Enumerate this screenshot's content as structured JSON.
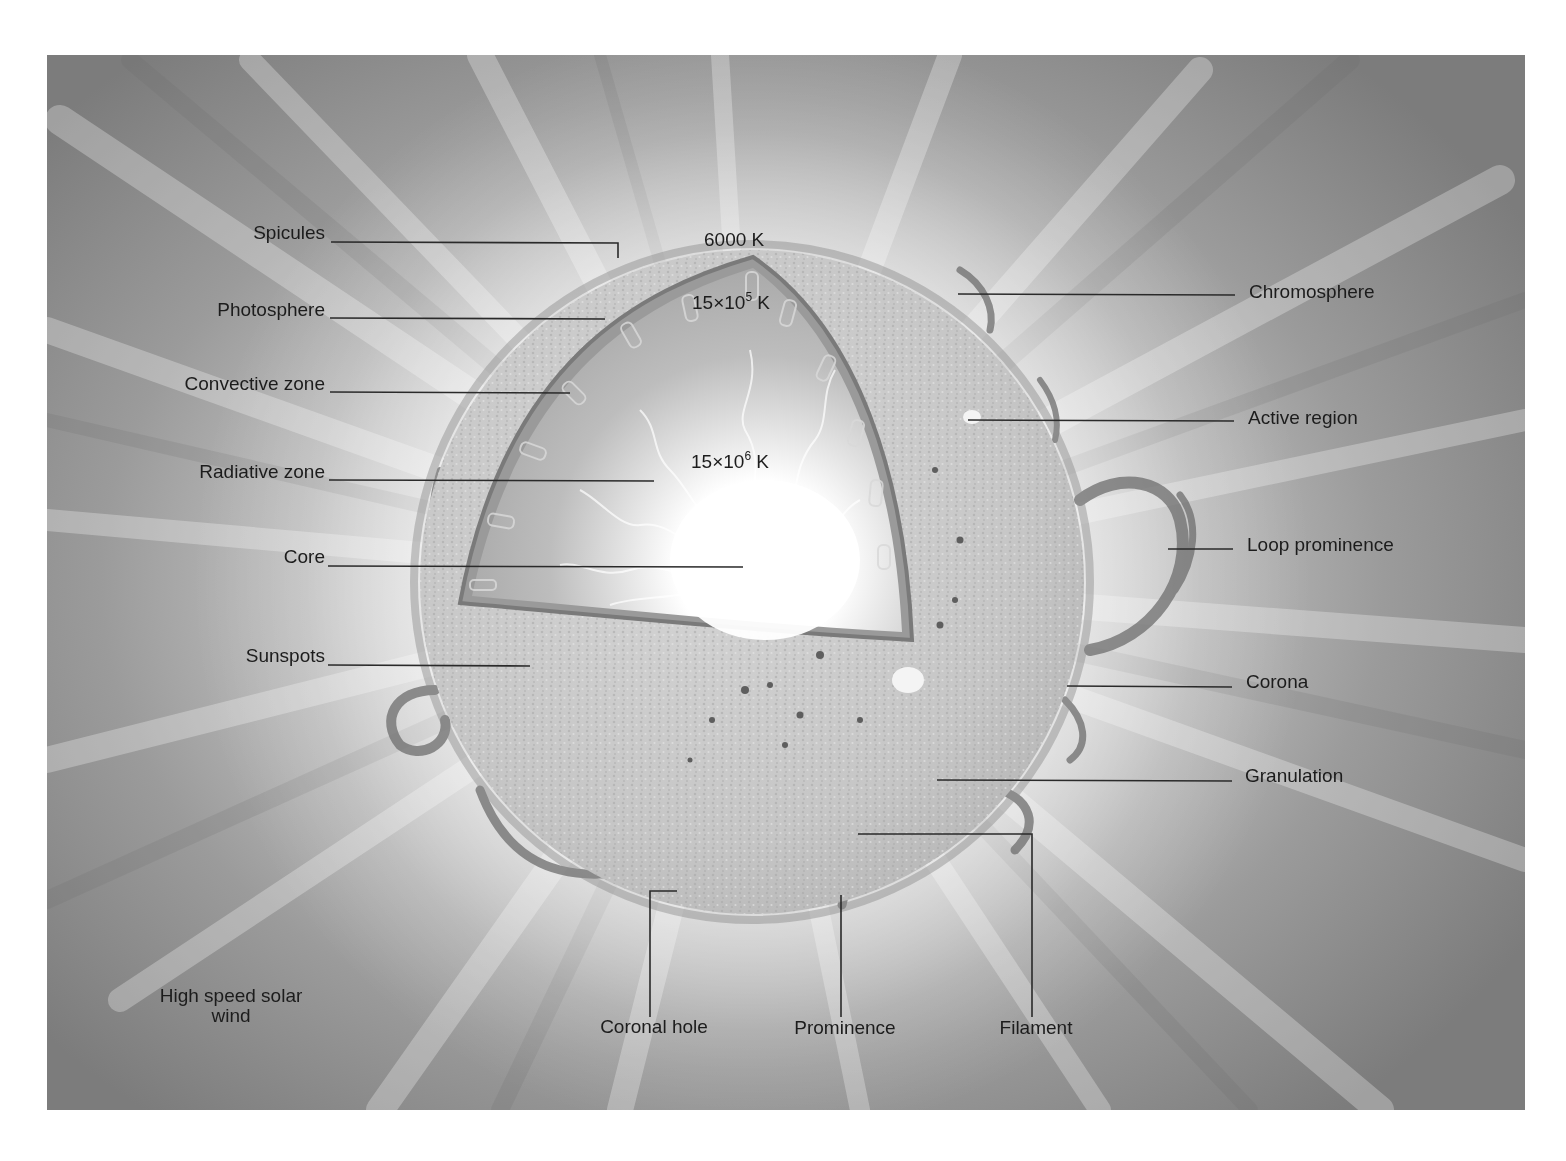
{
  "diagram": {
    "colors": {
      "text": "#1c1c1c",
      "leader_line": "#2a2a2a",
      "background_edge": "#7c7c7c",
      "background_center": "#ececec",
      "photosphere_surface": "#c9c9c9",
      "cutaway_interior": "#b5b5b5",
      "core_glow": "#ffffff",
      "prominence": "#6e6e6e"
    },
    "temperatures": {
      "surface": {
        "value": "6000 K"
      },
      "convective_base": {
        "mantissa": "15×10",
        "exponent": "5",
        "unit": " K"
      },
      "core": {
        "mantissa": "15×10",
        "exponent": "6",
        "unit": " K"
      }
    },
    "labels_left": [
      {
        "id": "spicules",
        "text": "Spicules"
      },
      {
        "id": "photosphere",
        "text": "Photosphere"
      },
      {
        "id": "convective-zone",
        "text": "Convective zone"
      },
      {
        "id": "radiative-zone",
        "text": "Radiative zone"
      },
      {
        "id": "core",
        "text": "Core"
      },
      {
        "id": "sunspots",
        "text": "Sunspots"
      },
      {
        "id": "high-speed-solar-wind",
        "text": "High speed solar wind"
      }
    ],
    "labels_right": [
      {
        "id": "chromosphere",
        "text": "Chromosphere"
      },
      {
        "id": "active-region",
        "text": "Active region"
      },
      {
        "id": "loop-prominence",
        "text": "Loop prominence"
      },
      {
        "id": "corona",
        "text": "Corona"
      },
      {
        "id": "granulation",
        "text": "Granulation"
      }
    ],
    "labels_bottom": [
      {
        "id": "coronal-hole",
        "text": "Coronal hole"
      },
      {
        "id": "prominence",
        "text": "Prominence"
      },
      {
        "id": "filament",
        "text": "Filament"
      }
    ]
  }
}
